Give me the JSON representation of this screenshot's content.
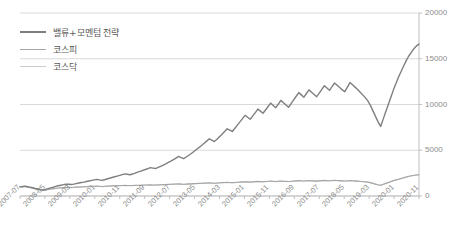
{
  "chart_data": {
    "type": "line",
    "title": "",
    "subtitle": "",
    "xlabel": "",
    "ylabel": "",
    "ylim": [
      0,
      20000
    ],
    "yticks": [
      0,
      5000,
      10000,
      15000,
      20000
    ],
    "ytick_labels": [
      "0",
      "5000",
      "10000",
      "15000",
      "20000"
    ],
    "grid": true,
    "y_axis_position": "right",
    "legend_position": "top-left",
    "xtick_labels": [
      "2007-07",
      "2008-05",
      "2009-03",
      "2010-01",
      "2010-11",
      "2011-09",
      "2012-07",
      "2013-05",
      "2014-03",
      "2015-01",
      "2015-11",
      "2016-09",
      "2017-07",
      "2018-05",
      "2019-03",
      "2020-01",
      "2020-11"
    ],
    "x_start": "2007-07",
    "x_end": "2021-03",
    "series": [
      {
        "name": "밸류+모멘텀 전략",
        "color": "#7f7f7f",
        "width": 1.4,
        "values": [
          1000,
          1040,
          1080,
          1010,
          950,
          900,
          820,
          760,
          700,
          640,
          720,
          800,
          880,
          960,
          1050,
          1120,
          1180,
          1240,
          1300,
          1280,
          1250,
          1300,
          1360,
          1420,
          1470,
          1520,
          1580,
          1640,
          1700,
          1760,
          1820,
          1760,
          1700,
          1780,
          1860,
          1940,
          2020,
          2100,
          2180,
          2260,
          2340,
          2420,
          2380,
          2320,
          2400,
          2500,
          2600,
          2700,
          2800,
          2900,
          3000,
          3100,
          3050,
          3000,
          3120,
          3250,
          3380,
          3520,
          3680,
          3820,
          3980,
          4150,
          4320,
          4200,
          4080,
          4260,
          4450,
          4650,
          4860,
          5080,
          5300,
          5520,
          5760,
          6000,
          6250,
          6100,
          5950,
          6200,
          6480,
          6760,
          7050,
          7350,
          7200,
          7050,
          7400,
          7750,
          8100,
          8450,
          8820,
          8600,
          8380,
          8750,
          9120,
          9500,
          9280,
          9050,
          9400,
          9780,
          10150,
          9900,
          9650,
          10050,
          10450,
          10200,
          9950,
          9700,
          10100,
          10500,
          10900,
          11300,
          11050,
          10800,
          11200,
          11600,
          11350,
          11100,
          10850,
          11250,
          11650,
          12050,
          11800,
          11550,
          11950,
          12350,
          12100,
          11850,
          11600,
          11400,
          11900,
          12400,
          12150,
          11900,
          11650,
          11350,
          11050,
          10750,
          10400,
          9900,
          9300,
          8700,
          8100,
          7600,
          8400,
          9200,
          10000,
          10800,
          11600,
          12300,
          13000,
          13600,
          14200,
          14800,
          15300,
          15700,
          16100,
          16400,
          16600
        ]
      },
      {
        "name": "코스피",
        "color": "#a6a6a6",
        "width": 1.1,
        "values": [
          1000,
          1020,
          1040,
          980,
          920,
          870,
          790,
          720,
          650,
          600,
          660,
          720,
          760,
          800,
          840,
          870,
          900,
          930,
          950,
          940,
          930,
          950,
          970,
          990,
          1000,
          1010,
          1030,
          1050,
          1060,
          1070,
          1080,
          1060,
          1040,
          1060,
          1080,
          1100,
          1110,
          1120,
          1130,
          1140,
          1150,
          1160,
          1150,
          1140,
          1150,
          1160,
          1170,
          1180,
          1190,
          1200,
          1210,
          1220,
          1210,
          1200,
          1215,
          1230,
          1245,
          1260,
          1275,
          1290,
          1300,
          1310,
          1320,
          1300,
          1285,
          1300,
          1320,
          1335,
          1350,
          1365,
          1380,
          1395,
          1410,
          1425,
          1440,
          1420,
          1400,
          1420,
          1440,
          1460,
          1480,
          1500,
          1480,
          1460,
          1480,
          1500,
          1520,
          1540,
          1560,
          1540,
          1520,
          1545,
          1570,
          1595,
          1575,
          1555,
          1580,
          1605,
          1630,
          1610,
          1590,
          1615,
          1640,
          1620,
          1600,
          1580,
          1605,
          1630,
          1655,
          1680,
          1660,
          1640,
          1665,
          1690,
          1670,
          1650,
          1630,
          1655,
          1680,
          1705,
          1685,
          1665,
          1690,
          1715,
          1695,
          1675,
          1655,
          1635,
          1660,
          1690,
          1670,
          1650,
          1630,
          1605,
          1580,
          1555,
          1520,
          1460,
          1380,
          1300,
          1230,
          1180,
          1280,
          1380,
          1480,
          1580,
          1680,
          1760,
          1840,
          1920,
          2000,
          2080,
          2150,
          2210,
          2260,
          2300,
          2330
        ]
      },
      {
        "name": "코스닥",
        "color": "#cccccc",
        "width": 1.1,
        "values": [
          1000,
          1010,
          1020,
          960,
          900,
          850,
          770,
          700,
          630,
          580,
          640,
          700,
          740,
          780,
          820,
          850,
          880,
          910,
          930,
          920,
          910,
          930,
          950,
          970,
          980,
          990,
          1010,
          1030,
          1040,
          1050,
          1060,
          1040,
          1020,
          1040,
          1060,
          1080,
          1090,
          1100,
          1110,
          1120,
          1130,
          1140,
          1130,
          1120,
          1130,
          1140,
          1150,
          1160,
          1170,
          1180,
          1190,
          1200,
          1190,
          1180,
          1195,
          1210,
          1225,
          1240,
          1255,
          1270,
          1280,
          1290,
          1300,
          1280,
          1265,
          1280,
          1300,
          1315,
          1330,
          1345,
          1360,
          1375,
          1390,
          1405,
          1420,
          1400,
          1380,
          1400,
          1420,
          1440,
          1460,
          1480,
          1460,
          1440,
          1460,
          1480,
          1500,
          1520,
          1540,
          1520,
          1500,
          1525,
          1550,
          1575,
          1555,
          1535,
          1560,
          1585,
          1610,
          1590,
          1570,
          1595,
          1620,
          1600,
          1580,
          1560,
          1585,
          1610,
          1635,
          1660,
          1640,
          1620,
          1645,
          1670,
          1650,
          1630,
          1610,
          1635,
          1660,
          1685,
          1665,
          1645,
          1670,
          1695,
          1675,
          1655,
          1635,
          1615,
          1640,
          1670,
          1650,
          1630,
          1610,
          1585,
          1560,
          1535,
          1500,
          1440,
          1360,
          1280,
          1210,
          1160,
          1260,
          1360,
          1460,
          1560,
          1660,
          1740,
          1820,
          1900,
          1980,
          2060,
          2130,
          2190,
          2240,
          2280,
          2310
        ]
      }
    ]
  }
}
